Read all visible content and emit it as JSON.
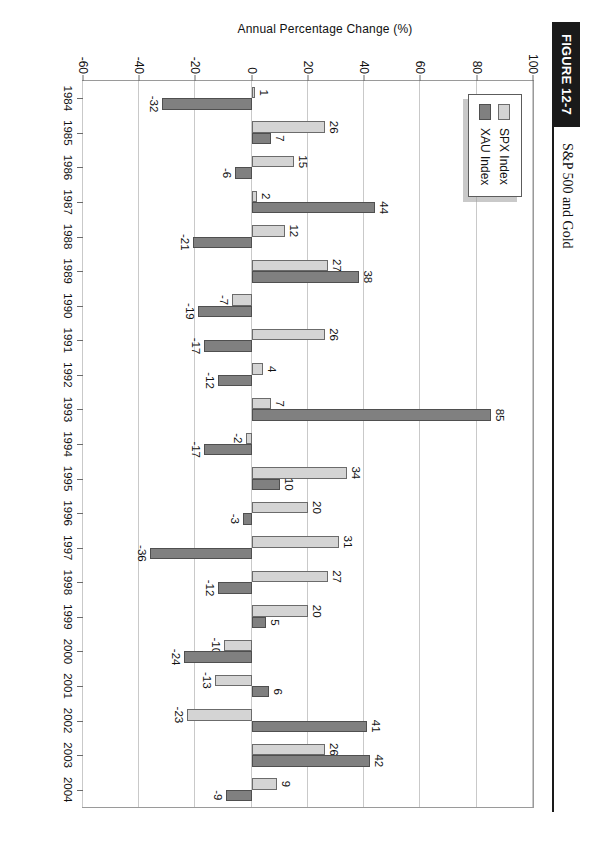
{
  "figure": {
    "tag": "FIGURE 12-7",
    "title": "S&P 500 and Gold"
  },
  "legend": {
    "position": "top-left-inside",
    "items": [
      {
        "label": "SPX Index",
        "color": "#d4d4d4",
        "swatch": "spx-swatch"
      },
      {
        "label": "XAU Index",
        "color": "#808080",
        "swatch": "xau-swatch"
      }
    ]
  },
  "axes": {
    "y_axis_label": "Annual Percentage Change (%)",
    "y_ticks": [
      "100",
      "80",
      "60",
      "40",
      "20",
      "0",
      "-20",
      "-40",
      "-60"
    ],
    "x_ticks": [
      "1984",
      "1985",
      "1986",
      "1987",
      "1988",
      "1989",
      "1990",
      "1991",
      "1992",
      "1993",
      "1994",
      "1995",
      "1996",
      "1997",
      "1998",
      "1999",
      "2000",
      "2001",
      "2002",
      "2003",
      "2004"
    ]
  },
  "chart_data": {
    "type": "bar",
    "title": "S&P 500 and Gold",
    "xlabel": "",
    "ylabel": "Annual Percentage Change (%)",
    "ylim": [
      -60,
      100
    ],
    "grid": true,
    "legend_position": "upper left",
    "categories": [
      "1984",
      "1985",
      "1986",
      "1987",
      "1988",
      "1989",
      "1990",
      "1991",
      "1992",
      "1993",
      "1994",
      "1995",
      "1996",
      "1997",
      "1998",
      "1999",
      "2000",
      "2001",
      "2002",
      "2003",
      "2004"
    ],
    "series": [
      {
        "name": "SPX Index",
        "color": "#d4d4d4",
        "values": [
          1,
          26,
          15,
          2,
          12,
          27,
          -7,
          26,
          4,
          7,
          -2,
          34,
          20,
          31,
          27,
          20,
          -10,
          -13,
          -23,
          26,
          9
        ]
      },
      {
        "name": "XAU Index",
        "color": "#808080",
        "values": [
          -32,
          7,
          -6,
          44,
          -21,
          38,
          -19,
          -17,
          -12,
          85,
          -17,
          10,
          -3,
          -36,
          -12,
          5,
          -24,
          6,
          41,
          42,
          -9
        ]
      }
    ],
    "data_labels": [
      {
        "year": "1984",
        "spx": "1",
        "xau": "-32"
      },
      {
        "year": "1985",
        "spx": "26",
        "xau": "7"
      },
      {
        "year": "1986",
        "spx": "15",
        "xau": "-6"
      },
      {
        "year": "1987",
        "spx": "2",
        "xau": "44"
      },
      {
        "year": "1988",
        "spx": "12",
        "xau": "-21"
      },
      {
        "year": "1989",
        "spx": "27",
        "xau": "38"
      },
      {
        "year": "1990",
        "spx": "-7",
        "xau": "-19"
      },
      {
        "year": "1991",
        "spx": "26",
        "xau": "-17"
      },
      {
        "year": "1992",
        "spx": "4",
        "xau": "-12"
      },
      {
        "year": "1993",
        "spx": "7",
        "xau": "85"
      },
      {
        "year": "1994",
        "spx": "-2",
        "xau": "-17"
      },
      {
        "year": "1995",
        "spx": "34",
        "xau": "10"
      },
      {
        "year": "1996",
        "spx": "20",
        "xau": "-3"
      },
      {
        "year": "1997",
        "spx": "31",
        "xau": "-36"
      },
      {
        "year": "1998",
        "spx": "27",
        "xau": "-12"
      },
      {
        "year": "1999",
        "spx": "20",
        "xau": "5"
      },
      {
        "year": "2000",
        "spx": "-10",
        "xau": "-24"
      },
      {
        "year": "2001",
        "spx": "-13",
        "xau": "6"
      },
      {
        "year": "2002",
        "spx": "-23",
        "xau": "41"
      },
      {
        "year": "2003",
        "spx": "26",
        "xau": "42"
      },
      {
        "year": "2004",
        "spx": "9",
        "xau": "-9"
      }
    ]
  }
}
